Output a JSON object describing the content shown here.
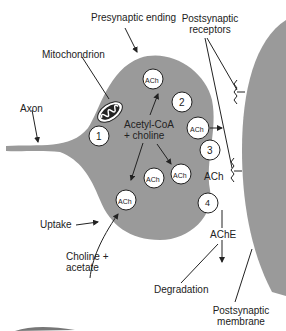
{
  "colors": {
    "tissue": "#9a9a9a",
    "ink": "#222222",
    "vesicle_fill": "#ffffff"
  },
  "labels": {
    "presynaptic_ending": "Presynaptic ending",
    "postsynaptic_receptors_1": "Postsynaptic",
    "postsynaptic_receptors_2": "receptors",
    "mitochondrion": "Mitochondrion",
    "axon": "Axon",
    "acetyl_coa_1": "Acetyl-CoA",
    "acetyl_coa_2": "+ choline",
    "ach_cleft": "ACh",
    "ache": "AChE",
    "uptake": "Uptake",
    "choline_acetate_1": "Choline +",
    "choline_acetate_2": "acetate",
    "degradation": "Degradation",
    "postsynaptic_membrane_1": "Postsynaptic",
    "postsynaptic_membrane_2": "membrane"
  },
  "steps": [
    "1",
    "2",
    "3",
    "4"
  ],
  "vesicles": [
    {
      "label": "ACh"
    },
    {
      "label": "ACh"
    },
    {
      "label": "ACh"
    },
    {
      "label": "ACh"
    },
    {
      "label": "ACh"
    }
  ]
}
